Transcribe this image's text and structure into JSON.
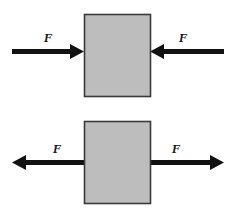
{
  "figure": {
    "background_color": "#ffffff",
    "width": 235,
    "height": 217
  },
  "style": {
    "block_fill": "#bdbdbd",
    "block_stroke": "#3a3a3a",
    "arrow_color": "#111111",
    "label_color": "#1a1a1a"
  },
  "panels": [
    {
      "id": "compression",
      "name": "top-panel",
      "description": "Block with two opposing forces pointing inward (compression)",
      "block": {
        "x": 84,
        "y": 14,
        "width": 66,
        "height": 82,
        "fill": "#bdbdbd",
        "stroke": "#3a3a3a"
      },
      "arrows": [
        {
          "id": "top-left-arrow",
          "direction": "right",
          "points_toward": "block",
          "tail_x": 12,
          "tip_x": 84,
          "y": 51,
          "label": "F",
          "label_x": 48,
          "label_y": 42
        },
        {
          "id": "top-right-arrow",
          "direction": "left",
          "points_toward": "block",
          "tail_x": 224,
          "tip_x": 150,
          "y": 51,
          "label": "F",
          "label_x": 183,
          "label_y": 42
        }
      ]
    },
    {
      "id": "tension",
      "name": "bottom-panel",
      "description": "Block with two opposing forces pointing outward (tension)",
      "block": {
        "x": 84,
        "y": 121,
        "width": 66,
        "height": 82,
        "fill": "#bdbdbd",
        "stroke": "#3a3a3a"
      },
      "arrows": [
        {
          "id": "bottom-left-arrow",
          "direction": "left",
          "points_toward": "away",
          "tail_x": 84,
          "tip_x": 12,
          "y": 162,
          "label": "F",
          "label_x": 57,
          "label_y": 153
        },
        {
          "id": "bottom-right-arrow",
          "direction": "right",
          "points_toward": "away",
          "tail_x": 150,
          "tip_x": 224,
          "y": 162,
          "label": "F",
          "label_x": 176,
          "label_y": 153
        }
      ]
    }
  ]
}
